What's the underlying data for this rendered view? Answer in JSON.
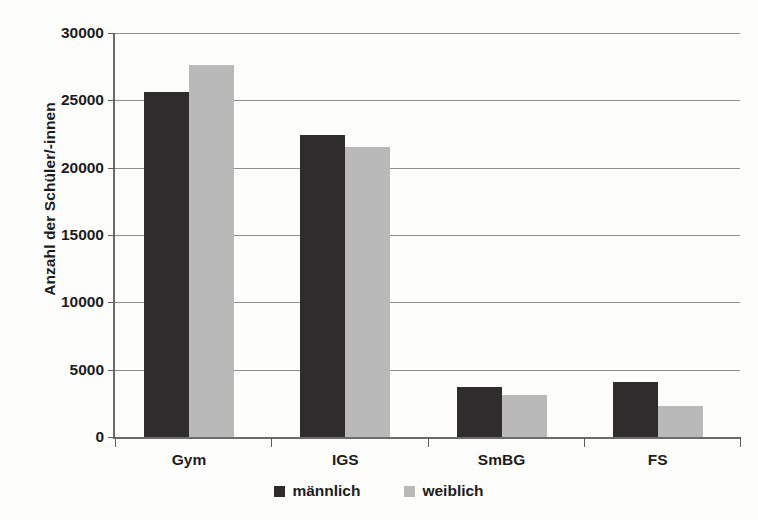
{
  "chart_data": {
    "type": "bar",
    "title": "",
    "xlabel": "",
    "ylabel": "Anzahl der Schüler/-innen",
    "categories": [
      "Gym",
      "IGS",
      "SmBG",
      "FS"
    ],
    "series": [
      {
        "name": "männlich",
        "color": "#2e2c2d",
        "values": [
          25600,
          22400,
          3700,
          4100
        ]
      },
      {
        "name": "weiblich",
        "color": "#b9b9b9",
        "values": [
          27600,
          21500,
          3100,
          2300
        ]
      }
    ],
    "ylim": [
      0,
      30000
    ],
    "yticks": [
      0,
      5000,
      10000,
      15000,
      20000,
      25000,
      30000
    ],
    "ytick_labels": [
      "0",
      "5000",
      "10000",
      "15000",
      "20000",
      "25000",
      "30000"
    ],
    "grid": true,
    "legend_position": "bottom"
  },
  "legend": {
    "items": [
      {
        "label": "männlich",
        "swatch": "male"
      },
      {
        "label": "weiblich",
        "swatch": "female"
      }
    ]
  }
}
